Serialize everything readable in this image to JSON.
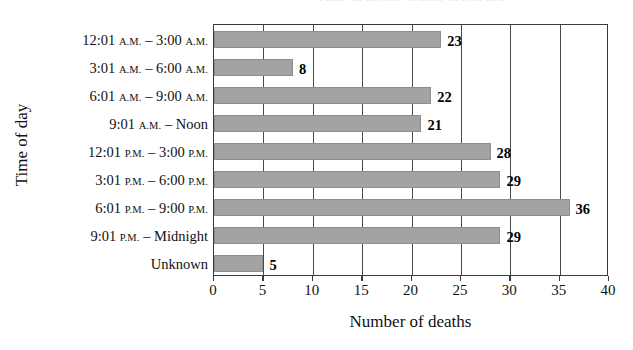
{
  "chart_data": {
    "type": "bar",
    "orientation": "horizontal",
    "title": "Time of death: traffic accidents",
    "xlabel": "Number of deaths",
    "ylabel": "Time of day",
    "categories": [
      "12:01 A.M. – 3:00 A.M.",
      "3:01 A.M. – 6:00 A.M.",
      "6:01 A.M. – 9:00 A.M.",
      "9:01 A.M. – Noon",
      "12:01 P.M. – 3:00 P.M.",
      "3:01 P.M. – 6:00 P.M.",
      "6:01 P.M. – 9:00 P.M.",
      "9:01 P.M. – Midnight",
      "Unknown"
    ],
    "values": [
      23,
      8,
      22,
      21,
      28,
      29,
      36,
      29,
      5
    ],
    "data_labels": [
      "23",
      "8",
      "22",
      "21",
      "28",
      "29",
      "36",
      "29",
      "5"
    ],
    "xlim": [
      0,
      40
    ],
    "xticks": [
      0,
      5,
      10,
      15,
      20,
      25,
      30,
      35,
      40
    ],
    "xtick_labels": [
      "0",
      "5",
      "10",
      "15",
      "20",
      "25",
      "30",
      "35",
      "40"
    ],
    "grid": "vertical",
    "legend": null,
    "bar_color": "#a3a3a3",
    "bar_edge_color": "#8d8d8d",
    "axis_color": "#3a3a3a",
    "background_color": "#ffffff"
  },
  "category_parts": [
    {
      "pre": "12:01 ",
      "sc1": "A.M.",
      "mid": " – 3:00 ",
      "sc2": "A.M."
    },
    {
      "pre": "3:01 ",
      "sc1": "A.M.",
      "mid": " – 6:00 ",
      "sc2": "A.M."
    },
    {
      "pre": "6:01 ",
      "sc1": "A.M.",
      "mid": " – 9:00 ",
      "sc2": "A.M."
    },
    {
      "pre": "9:01 ",
      "sc1": "A.M.",
      "mid": " – Noon",
      "sc2": ""
    },
    {
      "pre": "12:01 ",
      "sc1": "P.M.",
      "mid": " – 3:00 ",
      "sc2": "P.M."
    },
    {
      "pre": "3:01 ",
      "sc1": "P.M.",
      "mid": " – 6:00 ",
      "sc2": "P.M."
    },
    {
      "pre": "6:01 ",
      "sc1": "P.M.",
      "mid": " – 9:00 ",
      "sc2": "P.M."
    },
    {
      "pre": "9:01 ",
      "sc1": "P.M.",
      "mid": " – Midnight",
      "sc2": ""
    },
    {
      "pre": "Unknown",
      "sc1": "",
      "mid": "",
      "sc2": ""
    }
  ]
}
